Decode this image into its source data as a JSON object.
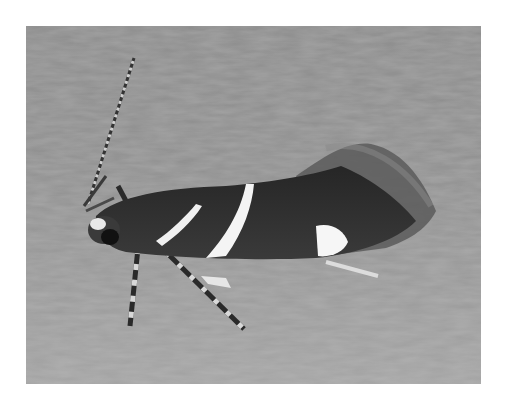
{
  "image": {
    "subject": "moth",
    "description": "Dark moth with white wing bands and a long banded antenna resting on a gray textured surface",
    "colors": {
      "frame": "#ffffff",
      "surface": "#909090",
      "wing": "#2e2e2e",
      "band": "#f2f2f2"
    }
  }
}
